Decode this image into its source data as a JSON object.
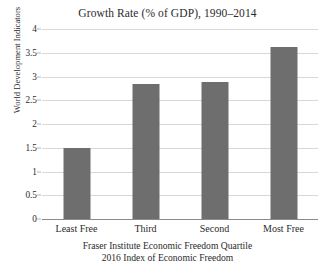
{
  "chart_data": {
    "type": "bar",
    "title": "Growth Rate (% of GDP), 1990–2014",
    "categories": [
      "Least Free",
      "Third",
      "Second",
      "Most Free"
    ],
    "values": [
      1.5,
      2.85,
      2.89,
      3.62
    ],
    "xlabel": "Fraser Institute Economic Freedom Quartile",
    "xlabel_line2": "2016 Index of Economic Freedom",
    "ylabel": "World Development Indicators",
    "ylim": [
      0,
      4
    ],
    "yticks": [
      "0",
      "0.5",
      "1",
      "1.5",
      "2",
      "2.5",
      "3",
      "3.5",
      "4"
    ],
    "ytick_values": [
      0,
      0.5,
      1,
      1.5,
      2,
      2.5,
      3,
      3.5,
      4
    ],
    "grid": true,
    "legend": false,
    "bar_color": "#6e6e6e",
    "gridline_color": "#d8d8d8",
    "axis_color": "#8a8a8a",
    "background": "#ffffff"
  }
}
